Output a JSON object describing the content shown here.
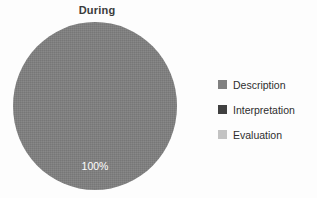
{
  "chart_data": {
    "type": "pie",
    "title": "During",
    "categories": [
      "Description",
      "Interpretation",
      "Evaluation"
    ],
    "values": [
      100,
      0,
      0
    ],
    "value_labels": [
      "100%",
      "",
      ""
    ],
    "colors": [
      "#808080",
      "#404040",
      "#c3c3c3"
    ],
    "legend_position": "right",
    "grid": false,
    "xlabel": "",
    "ylabel": "",
    "background": "#ffffff",
    "slices": [
      {
        "name": "Description",
        "value": 100,
        "label": "100%",
        "color": "#808080"
      },
      {
        "name": "Interpretation",
        "value": 0,
        "label": "",
        "color": "#404040"
      },
      {
        "name": "Evaluation",
        "value": 0,
        "label": "",
        "color": "#c3c3c3"
      }
    ]
  },
  "title": {
    "text": "During"
  },
  "pie": {
    "slice_label": "100%"
  },
  "legend": {
    "items": [
      {
        "label": "Description",
        "color": "#808080"
      },
      {
        "label": "Interpretation",
        "color": "#404040"
      },
      {
        "label": "Evaluation",
        "color": "#c3c3c3"
      }
    ]
  }
}
